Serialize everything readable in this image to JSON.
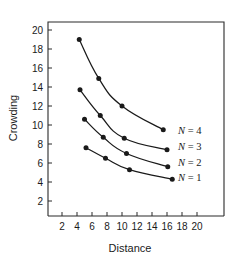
{
  "chart_data": {
    "type": "line",
    "title": "",
    "xlabel": "Distance",
    "ylabel": "Crowding",
    "xlim": [
      0,
      21.2
    ],
    "ylim": [
      0.5,
      21.2
    ],
    "grid": false,
    "legend_position": "right-inside",
    "x_ticks": [
      2,
      4,
      6,
      8,
      10,
      12,
      14,
      16,
      18,
      20
    ],
    "y_ticks": [
      2,
      4,
      6,
      8,
      10,
      12,
      14,
      16,
      18,
      20
    ],
    "x_tick_labels": [
      "2",
      "4",
      "6",
      "8",
      "10",
      "12",
      "14",
      "16",
      "18",
      "20"
    ],
    "y_tick_labels": [
      "2",
      "4",
      "6",
      "8",
      "10",
      "12",
      "14",
      "16",
      "18",
      "20"
    ],
    "marker": "filled-circle",
    "series": [
      {
        "name": "N = 4",
        "label_prefix": "N",
        "label_value": "4",
        "x": [
          4.3,
          6.9,
          10.0,
          15.5
        ],
        "values": [
          19.0,
          14.9,
          12.0,
          9.5
        ]
      },
      {
        "name": "N = 3",
        "label_prefix": "N",
        "label_value": "3",
        "x": [
          4.4,
          7.1,
          10.3,
          16.0
        ],
        "values": [
          13.7,
          11.0,
          8.6,
          7.4
        ]
      },
      {
        "name": "N = 2",
        "label_prefix": "N",
        "label_value": "2",
        "x": [
          5.0,
          7.5,
          10.6,
          16.1
        ],
        "values": [
          10.6,
          8.7,
          7.0,
          5.6
        ]
      },
      {
        "name": "N = 1",
        "label_prefix": "N",
        "label_value": "1",
        "x": [
          5.2,
          7.8,
          11.0,
          16.7
        ],
        "values": [
          7.6,
          6.5,
          5.3,
          4.3
        ]
      }
    ],
    "legend_entries": [
      {
        "text": "N = 4",
        "var": "N",
        "eq": " = ",
        "num": "4"
      },
      {
        "text": "N = 3",
        "var": "N",
        "eq": " = ",
        "num": "3"
      },
      {
        "text": "N = 2",
        "var": "N",
        "eq": " = ",
        "num": "2"
      },
      {
        "text": "N = 1",
        "var": "N",
        "eq": " = ",
        "num": "1"
      }
    ],
    "colors": {
      "line": "#1a1a1a",
      "marker": "#1a1a1a",
      "axis": "#2b2b2b",
      "text": "#1a1a1a",
      "background": "#ffffff"
    }
  }
}
